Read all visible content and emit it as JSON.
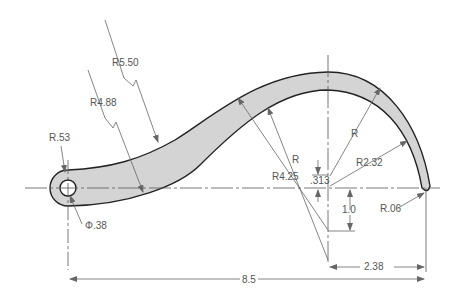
{
  "drawing": {
    "type": "engineering-drawing",
    "subject": "curved arm with hole",
    "colors": {
      "part_fill": "#d4d4d4",
      "part_outline": "#222222",
      "dim_line": "#666666",
      "text": "#555555"
    }
  },
  "dimensions": {
    "r550": "R5.50",
    "r488": "R4.88",
    "r053": "R.53",
    "dia038": "Φ.38",
    "r_outer": "R",
    "r_inner": "R",
    "r425": "R4.25",
    "r232": "R2.32",
    "d313": ".313",
    "d10": "1.0",
    "r006": "R.06",
    "d238": "2.38",
    "d85": "8.5"
  }
}
